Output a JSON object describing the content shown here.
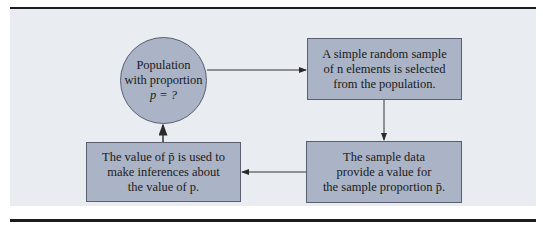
{
  "diagram": {
    "type": "flowchart-cycle",
    "nodes": [
      {
        "id": "population",
        "shape": "circle",
        "lines": [
          "Population",
          "with proportion",
          "p = ?"
        ]
      },
      {
        "id": "sample",
        "shape": "box",
        "lines": [
          "A simple random sample",
          "of n elements is selected",
          "from the population."
        ]
      },
      {
        "id": "sample_data",
        "shape": "box",
        "lines": [
          "The sample data",
          "provide a value for",
          "the sample proportion p̄."
        ]
      },
      {
        "id": "inference",
        "shape": "box",
        "lines": [
          "The value of p̄ is used to",
          "make inferences about",
          "the value of p."
        ]
      }
    ],
    "edges": [
      {
        "from": "population",
        "to": "sample"
      },
      {
        "from": "sample",
        "to": "sample_data"
      },
      {
        "from": "sample_data",
        "to": "inference"
      },
      {
        "from": "inference",
        "to": "population"
      }
    ],
    "colors": {
      "node_fill": "#aab4c6",
      "panel": "#e9edf2",
      "rule": "#1c1c1c",
      "line": "#333333"
    }
  }
}
